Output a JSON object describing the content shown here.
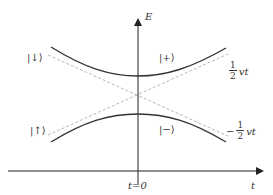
{
  "diagram": {
    "type": "avoided-crossing energy diagram",
    "axes": {
      "y_label": "E",
      "x_label": "t",
      "origin_label": "t=0"
    },
    "states": {
      "upper_right": "|+⟩",
      "lower_right": "|−⟩",
      "upper_left": "|↓⟩",
      "lower_left": "|↑⟩"
    },
    "asymptotes": {
      "upper": {
        "sign": "",
        "numerator": "1",
        "denominator": "2",
        "variable": "vt"
      },
      "lower": {
        "sign": "−",
        "numerator": "1",
        "denominator": "2",
        "variable": "vt"
      }
    },
    "colors": {
      "axis": "#222222",
      "curve": "#333333",
      "dashed": "#b0b0b0",
      "text": "#333333"
    }
  }
}
